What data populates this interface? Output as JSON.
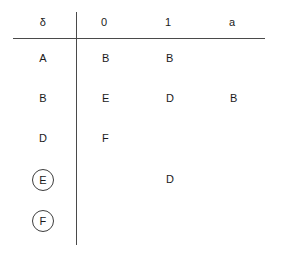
{
  "table": {
    "corner_symbol": "δ",
    "columns": [
      "0",
      "1",
      "a"
    ],
    "rows": [
      {
        "state": "A",
        "accepting": false,
        "cells": [
          "B",
          "B",
          ""
        ]
      },
      {
        "state": "B",
        "accepting": false,
        "cells": [
          "E",
          "D",
          "B"
        ]
      },
      {
        "state": "D",
        "accepting": false,
        "cells": [
          "F",
          "",
          ""
        ]
      },
      {
        "state": "E",
        "accepting": true,
        "cells": [
          "",
          "D",
          ""
        ]
      },
      {
        "state": "F",
        "accepting": true,
        "cells": [
          "",
          "",
          ""
        ]
      }
    ]
  },
  "style": {
    "rule_color": "#4a4a4a",
    "text_color": "#1a1a1a",
    "background": "#ffffff"
  }
}
